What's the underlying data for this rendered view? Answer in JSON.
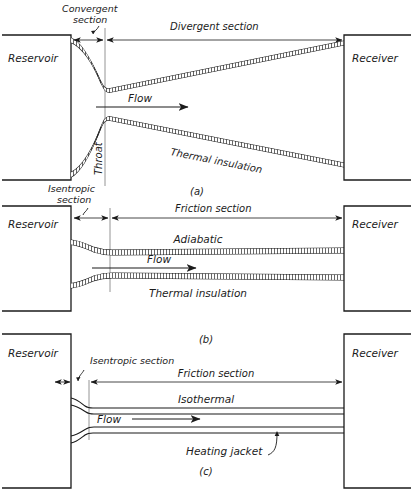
{
  "figure": {
    "title_caption_a": "(a)",
    "title_caption_b": "(b)",
    "title_caption_c": "(c)",
    "ink_color": "#1b1b1b",
    "background_color": "#ffffff"
  },
  "panel_a": {
    "caption": "(a)",
    "reservoir": "Reservoir",
    "receiver": "Receiver",
    "convergent_section": "Convergent",
    "convergent_section_2": "section",
    "divergent_section": "Divergent section",
    "flow": "Flow",
    "throat": "Throat",
    "thermal_insulation": "Thermal insulation"
  },
  "panel_b": {
    "caption": "(b)",
    "reservoir": "Reservoir",
    "receiver": "Receiver",
    "isentropic_section": "Isentropic",
    "isentropic_section_2": "section",
    "friction_section": "Friction section",
    "adiabatic": "Adiabatic",
    "flow": "Flow",
    "thermal_insulation": "Thermal insulation"
  },
  "panel_c": {
    "caption": "(c)",
    "reservoir": "Reservoir",
    "receiver": "Receiver",
    "isentropic_section": "Isentropic section",
    "friction_section": "Friction section",
    "isothermal": "Isothermal",
    "flow": "Flow",
    "heating_jacket": "Heating jacket"
  }
}
